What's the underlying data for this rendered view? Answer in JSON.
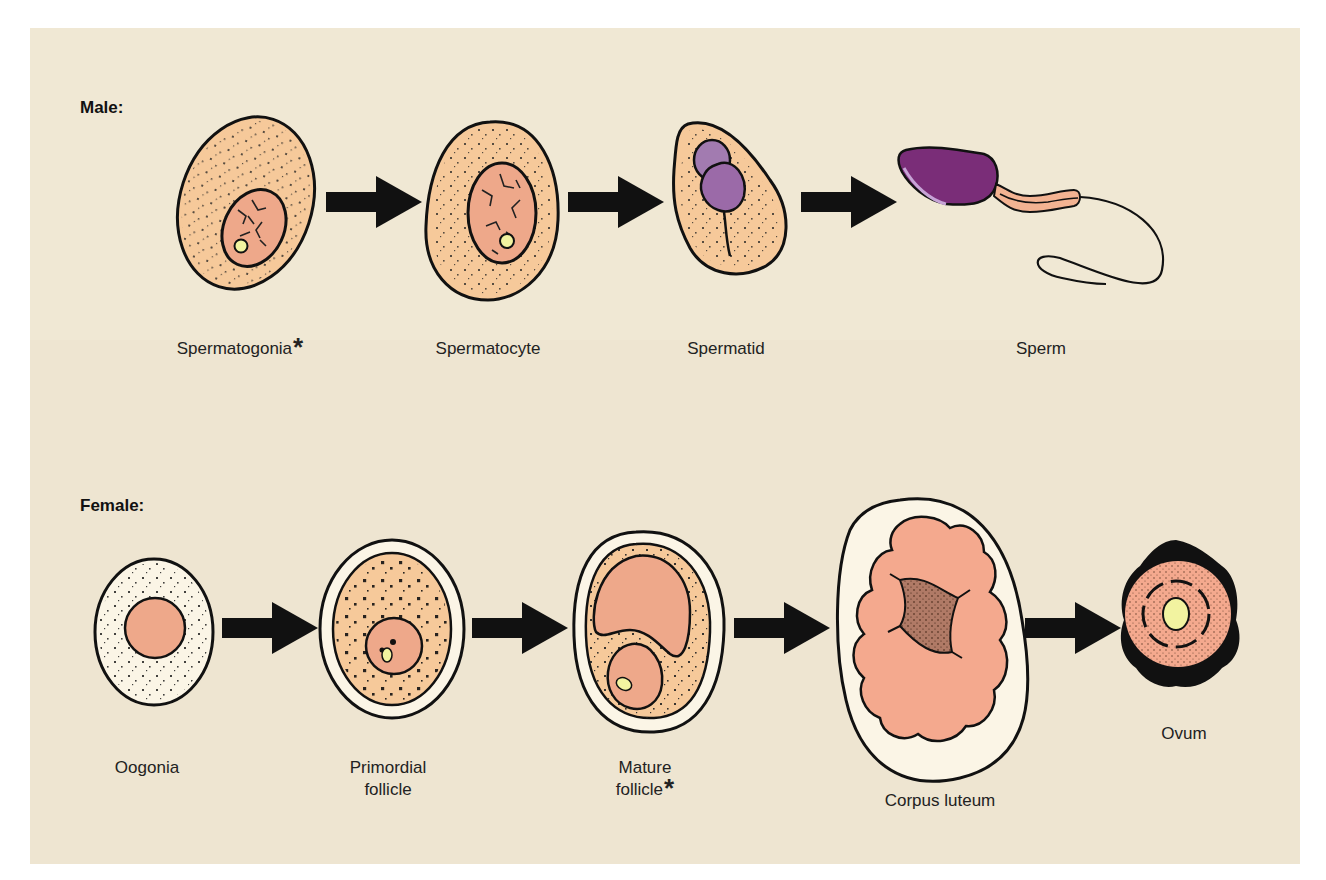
{
  "male": {
    "title": "Male:",
    "stages": [
      {
        "label": "Spermatogonia",
        "marker": "*"
      },
      {
        "label": "Spermatocyte",
        "marker": ""
      },
      {
        "label": "Spermatid",
        "marker": ""
      },
      {
        "label": "Sperm",
        "marker": ""
      }
    ]
  },
  "female": {
    "title": "Female:",
    "stages": [
      {
        "label": "Oogonia",
        "line2": "",
        "marker": ""
      },
      {
        "label": "Primordial",
        "line2": "follicle",
        "marker": ""
      },
      {
        "label": "Mature",
        "line2": "follicle",
        "marker": "*"
      },
      {
        "label": "Corpus luteum",
        "line2": "",
        "marker": ""
      },
      {
        "label": "Ovum",
        "line2": "",
        "marker": ""
      }
    ]
  },
  "colors": {
    "background": "#efe5d2",
    "cytoplasm": "#f6c99a",
    "nucleus": "#eea88a",
    "nucleolus": "#f2f3a0",
    "acrosome": "#7a2d78",
    "purple_light": "#a27bb0",
    "follicle_wall": "#fbf4e6",
    "outline": "#111111"
  }
}
